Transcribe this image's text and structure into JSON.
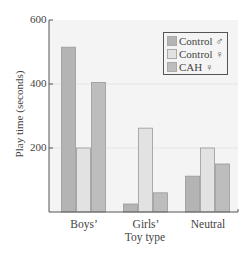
{
  "chart_data": {
    "type": "bar",
    "title": "",
    "xlabel": "Toy type",
    "ylabel": "Play time (seconds)",
    "ylim": [
      0,
      600
    ],
    "yticks": [
      200,
      400,
      600
    ],
    "grid": true,
    "legend_position": "upper right",
    "categories": [
      "Boys’",
      "Girls’",
      "Neutral"
    ],
    "series": [
      {
        "name": "Control ♂",
        "color": "#b4b4b4",
        "values": [
          515,
          25,
          112
        ]
      },
      {
        "name": "Control ♀",
        "color": "#e2e2e2",
        "values": [
          200,
          262,
          200
        ]
      },
      {
        "name": "CAH ♀",
        "color": "#bdbdbd",
        "values": [
          405,
          60,
          150
        ]
      }
    ]
  },
  "axis": {
    "ytick_labels": [
      "600",
      "400",
      "200"
    ],
    "xlabel": "Toy type",
    "ylabel": "Play time (seconds)"
  },
  "legend": {
    "items": [
      {
        "label": "Control ♂",
        "color": "#b4b4b4"
      },
      {
        "label": "Control ♀",
        "color": "#e2e2e2"
      },
      {
        "label": "CAH ♀",
        "color": "#bdbdbd"
      }
    ]
  },
  "colors": {
    "plot_background": "#f4f4f4",
    "gridline": "#e6e6e6",
    "axis": "#555555",
    "bar_border": "#9a9a9a"
  }
}
